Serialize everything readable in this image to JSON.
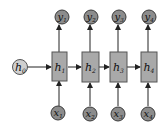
{
  "diagram": {
    "type": "unrolled-rnn",
    "colors": {
      "box_fill": "#a9a9a9",
      "box_stroke": "#555555",
      "node_fill": "#8c8c8c",
      "node_stroke": "#3a3a3a",
      "init_fill": "#cfcfcf",
      "edge": "#222222"
    },
    "initial_state": {
      "base": "h",
      "sub": "0"
    },
    "steps": [
      {
        "hidden": {
          "base": "h",
          "sub": "1"
        },
        "input": {
          "base": "x",
          "sub": "1"
        },
        "output": {
          "base": "y",
          "sub": "1"
        }
      },
      {
        "hidden": {
          "base": "h",
          "sub": "2"
        },
        "input": {
          "base": "x",
          "sub": "2"
        },
        "output": {
          "base": "y",
          "sub": "2"
        }
      },
      {
        "hidden": {
          "base": "h",
          "sub": "3"
        },
        "input": {
          "base": "x",
          "sub": "3"
        },
        "output": {
          "base": "y",
          "sub": "3"
        }
      },
      {
        "hidden": {
          "base": "h",
          "sub": "4"
        },
        "input": {
          "base": "x",
          "sub": "4"
        },
        "output": {
          "base": "y",
          "sub": "4"
        }
      }
    ]
  }
}
